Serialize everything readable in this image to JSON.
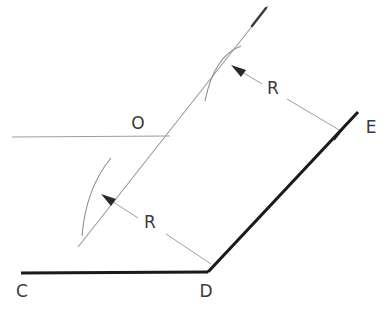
{
  "figure": {
    "type": "technical-line-drawing",
    "title": "",
    "background_color": "#ffffff",
    "width": 392,
    "height": 314
  },
  "colors": {
    "thick_line": "#1a1a1a",
    "thin_line": "#8a8a8a",
    "construction_line": "#9a9a9a",
    "arc": "#8f8f8f",
    "label_text": "#3a3a3a",
    "arrowhead": "#2a2a2a"
  },
  "labels": {
    "point_c": "C",
    "point_d": "D",
    "point_e": "E",
    "point_o": "O",
    "radius_upper": "R",
    "radius_lower": "R"
  },
  "geometry": {
    "points": {
      "C": {
        "x": 21,
        "y": 273
      },
      "D": {
        "x": 208,
        "y": 272
      },
      "E": {
        "x": 358,
        "y": 112
      },
      "O": {
        "x": 148,
        "y": 140
      }
    },
    "thick_segments": [
      {
        "name": "CD",
        "from": "C",
        "to": "D"
      },
      {
        "name": "DE",
        "from": "D",
        "to": "E"
      }
    ],
    "construction_diagonal": {
      "x1": 78,
      "y1": 247,
      "x2": 268,
      "y2": 6,
      "has_arrow_tip": true
    },
    "tangent_horizontal": {
      "x1": 12,
      "y1": 137,
      "x2": 170,
      "y2": 136
    },
    "arc_upper": {
      "start_x": 241,
      "start_y": 46,
      "end_x": 205,
      "end_y": 101
    },
    "arc_lower": {
      "start_x": 111,
      "start_y": 158,
      "end_x": 82,
      "end_y": 236
    },
    "dim_upper": {
      "tip_x": 232,
      "tip_y": 66,
      "end_x": 341,
      "end_y": 131,
      "label_x": 273,
      "label_y": 88
    },
    "dim_lower": {
      "tip_x": 102,
      "tip_y": 195,
      "end_x": 211,
      "end_y": 264,
      "label_x": 150,
      "label_y": 222
    }
  },
  "label_positions": {
    "C": {
      "x": 22,
      "y": 292
    },
    "D": {
      "x": 206,
      "y": 292
    },
    "E": {
      "x": 371,
      "y": 128
    },
    "O": {
      "x": 138,
      "y": 124
    }
  }
}
